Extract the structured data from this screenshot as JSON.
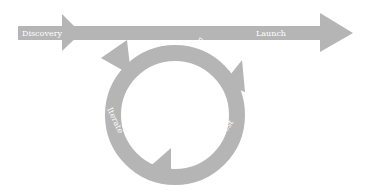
{
  "diagram": {
    "type": "process-flow",
    "colors": {
      "shape": "#b5b5b5",
      "text": "#ffffff",
      "background": "#ffffff"
    },
    "main_flow": {
      "start_label": "Discovery",
      "end_label": "Launch"
    },
    "cycle": {
      "labels": [
        "Build",
        "Test",
        "Iterate"
      ]
    }
  }
}
